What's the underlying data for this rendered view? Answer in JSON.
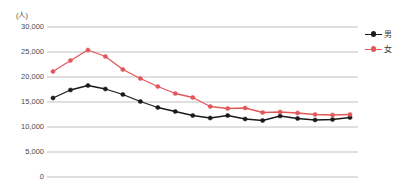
{
  "chart_data": {
    "type": "line",
    "title": "",
    "subtitle": "",
    "unit_label": "(人)",
    "xlabel": "",
    "ylabel": "",
    "ylim": [
      0,
      30000
    ],
    "y_ticks": [
      30000,
      25000,
      20000,
      15000,
      10000,
      5000,
      0
    ],
    "y_tick_labels": [
      "30,000",
      "25,000",
      "20,000",
      "15,000",
      "10,000",
      "5,000",
      "0"
    ],
    "x_tick_labels": [],
    "grid": true,
    "grid_axis": "y",
    "legend_position": "right",
    "x": [
      1,
      2,
      3,
      4,
      5,
      6,
      7,
      8,
      9,
      10,
      11,
      12,
      13,
      14,
      15,
      16,
      17,
      18
    ],
    "series": [
      {
        "name": "男",
        "color": "#1a1a1a",
        "marker": "circle",
        "values": [
          15800,
          17400,
          18300,
          17600,
          16500,
          15100,
          13900,
          13100,
          12300,
          11800,
          12300,
          11600,
          11300,
          12200,
          11700,
          11400,
          11500,
          11900
        ]
      },
      {
        "name": "女",
        "color": "#e2575a",
        "marker": "circle",
        "values": [
          21100,
          23300,
          25400,
          24100,
          21500,
          19700,
          18100,
          16700,
          15900,
          14100,
          13700,
          13800,
          12900,
          13000,
          12800,
          12500,
          12400,
          12500
        ]
      }
    ]
  },
  "legend": {
    "items": [
      {
        "label": "男",
        "color": "#1a1a1a"
      },
      {
        "label": "女",
        "color": "#e2575a"
      }
    ]
  },
  "colors": {
    "male_series": "#1a1a1a",
    "female_series": "#e2575a",
    "gridline": "#b9b9b9",
    "axis_text": "#4a4a4a"
  }
}
